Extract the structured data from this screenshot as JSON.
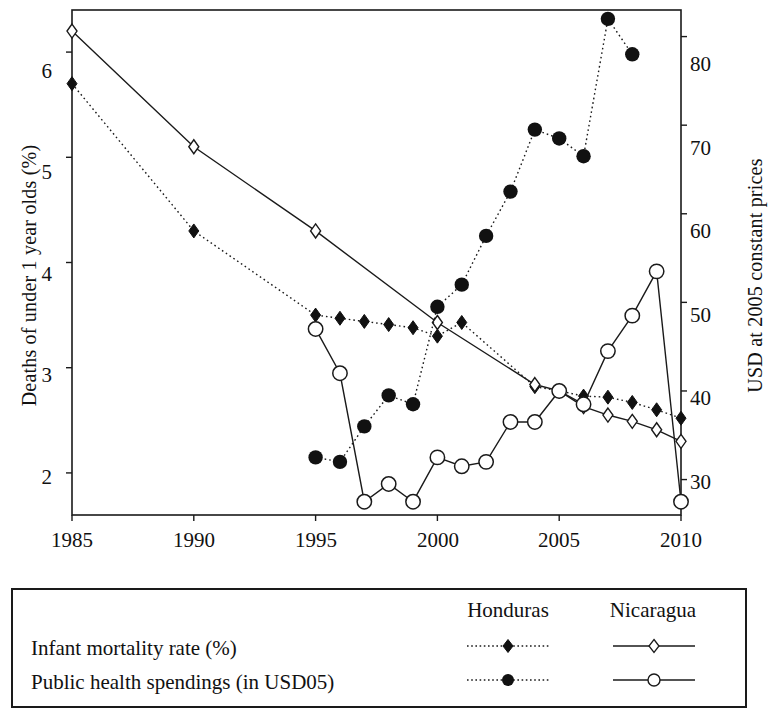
{
  "axes": {
    "y_left_label": "Deaths of under 1 year olds (%)",
    "y_right_label": "USD at 2005 constant prices",
    "y_left_ticks": [
      "2",
      "3",
      "4",
      "5",
      "6"
    ],
    "y_right_ticks": [
      "30",
      "40",
      "50",
      "60",
      "70",
      "80"
    ],
    "x_ticks": [
      "1985",
      "1990",
      "1995",
      "2000",
      "2005",
      "2010"
    ]
  },
  "legend": {
    "col_honduras": "Honduras",
    "col_nicaragua": "Nicaragua",
    "row_imr": "Infant mortality rate (%)",
    "row_spending": "Public health spendings (in USD05)"
  },
  "colors": {
    "ink": "#1a1a1a",
    "marker_fill": "#111111",
    "marker_open": "#ffffff"
  },
  "chart_data": {
    "type": "line",
    "title": "",
    "xlabel": "",
    "ylabel": "Deaths of under 1 year olds (%)",
    "ylabel_right": "USD at 2005 constant prices",
    "xlim": [
      1985,
      2010
    ],
    "ylim": [
      1.6,
      6.4
    ],
    "ylim_right": [
      26,
      83
    ],
    "grid": false,
    "legend_position": "below-plot",
    "series": [
      {
        "name": "Honduras — Infant mortality rate (%)",
        "country": "Honduras",
        "axis": "left",
        "marker": "filled-diamond",
        "line": "dotted",
        "x": [
          1985,
          1990,
          1995,
          1996,
          1997,
          1998,
          1999,
          2000,
          2001,
          2004,
          2005,
          2006,
          2007,
          2008,
          2009,
          2010
        ],
        "y": [
          5.7,
          4.3,
          3.5,
          3.47,
          3.44,
          3.41,
          3.38,
          3.3,
          3.43,
          2.82,
          2.78,
          2.73,
          2.72,
          2.67,
          2.6,
          2.52
        ]
      },
      {
        "name": "Nicaragua — Infant mortality rate (%)",
        "country": "Nicaragua",
        "axis": "left",
        "marker": "open-diamond",
        "line": "solid",
        "x": [
          1985,
          1990,
          1995,
          2000,
          2004,
          2005,
          2006,
          2007,
          2008,
          2009,
          2010
        ],
        "y": [
          6.2,
          5.1,
          4.3,
          3.43,
          2.84,
          2.78,
          2.63,
          2.55,
          2.49,
          2.41,
          2.3
        ]
      },
      {
        "name": "Honduras — Public health spendings (in USD05)",
        "country": "Honduras",
        "axis": "right",
        "marker": "filled-circle",
        "line": "dotted",
        "x": [
          1995,
          1996,
          1997,
          1998,
          1999,
          2000,
          2001,
          2002,
          2003,
          2004,
          2005,
          2006,
          2007,
          2008
        ],
        "y": [
          32.5,
          32.0,
          36.0,
          39.5,
          38.5,
          49.5,
          52.0,
          57.5,
          62.5,
          69.5,
          68.5,
          66.5,
          82.0,
          78.0
        ]
      },
      {
        "name": "Nicaragua — Public health spendings (in USD05)",
        "country": "Nicaragua",
        "axis": "right",
        "marker": "open-circle",
        "line": "solid",
        "x": [
          1995,
          1996,
          1997,
          1998,
          1999,
          2000,
          2001,
          2002,
          2003,
          2004,
          2005,
          2006,
          2007,
          2008,
          2009,
          2010
        ],
        "y": [
          47.0,
          42.0,
          27.5,
          29.5,
          27.5,
          32.5,
          31.5,
          32.0,
          36.5,
          36.5,
          40.0,
          38.5,
          44.5,
          48.5,
          53.5,
          27.5
        ]
      }
    ]
  }
}
